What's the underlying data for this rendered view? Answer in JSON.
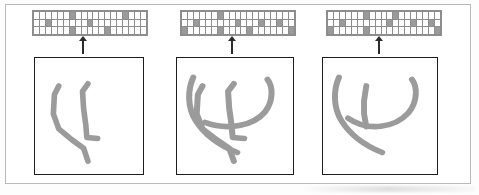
{
  "figure": {
    "panel_count": 3,
    "stroke_color": "#9b9b9b",
    "grid_on_color": "#9a9a9a",
    "grid_off_color": "#ffffff",
    "grid_line_color": "#8d8d8d",
    "box_border_color": "#1d1d1d",
    "outer_frame_color": "#b9b9b9",
    "arrow_color": "#2b2b2b",
    "arrow_direction": "up",
    "grid_rows": 3,
    "grid_cols": 19
  },
  "panels": [
    {
      "id": "panel-1",
      "name": "stage-1",
      "arrow_label": "feature-extraction-arrow",
      "grid": {
        "rows": 3,
        "cols": 19,
        "filled_cells": [
          [
            0,
            6
          ],
          [
            0,
            15
          ],
          [
            1,
            2
          ],
          [
            1,
            9
          ],
          [
            2,
            6
          ],
          [
            2,
            12
          ]
        ]
      },
      "sketch": {
        "name": "sketch-stage-1",
        "stroke_count": 2,
        "strokes": [
          "M 22 26 L 18 34 L 17 52 L 22 66 L 34 76 L 45 84 L 49 96",
          "M 49 24 L 44 31 L 45 47 L 47 62 L 48 74 L 58 75"
        ]
      }
    },
    {
      "id": "panel-2",
      "name": "stage-2",
      "arrow_label": "feature-extraction-arrow",
      "grid": {
        "rows": 3,
        "cols": 19,
        "filled_cells": [
          [
            0,
            6
          ],
          [
            1,
            2
          ],
          [
            1,
            9
          ],
          [
            1,
            13
          ],
          [
            1,
            16
          ],
          [
            2,
            0
          ],
          [
            2,
            6
          ],
          [
            2,
            11
          ],
          [
            2,
            18
          ]
        ]
      },
      "sketch": {
        "name": "sketch-stage-2",
        "stroke_count": 4,
        "strokes": [
          "M 22 26 L 18 34 L 17 52 L 22 66 L 34 76 L 45 84 L 49 96",
          "M 49 24 L 44 31 L 45 47 L 47 62 L 48 74 L 58 75",
          "M 14 18 C 9 30 9 46 16 58 C 24 72 38 82 52 88",
          "M 78 20 C 83 27 83 40 76 50 C 66 63 44 68 24 60"
        ]
      }
    },
    {
      "id": "panel-3",
      "name": "stage-3",
      "arrow_label": "feature-extraction-arrow",
      "grid": {
        "rows": 3,
        "cols": 19,
        "filled_cells": [
          [
            0,
            6
          ],
          [
            0,
            11
          ],
          [
            1,
            2
          ],
          [
            1,
            10
          ],
          [
            1,
            14
          ],
          [
            1,
            17
          ],
          [
            2,
            0
          ],
          [
            2,
            6
          ],
          [
            2,
            18
          ]
        ]
      },
      "sketch": {
        "name": "sketch-stage-3",
        "stroke_count": 3,
        "strokes": [
          "M 14 18 C 9 30 9 46 16 58 C 24 72 38 82 52 88",
          "M 38 26 L 36 40 L 36 52 L 38 64",
          "M 78 20 C 83 27 83 41 75 51 C 63 65 40 69 22 56"
        ]
      }
    }
  ]
}
